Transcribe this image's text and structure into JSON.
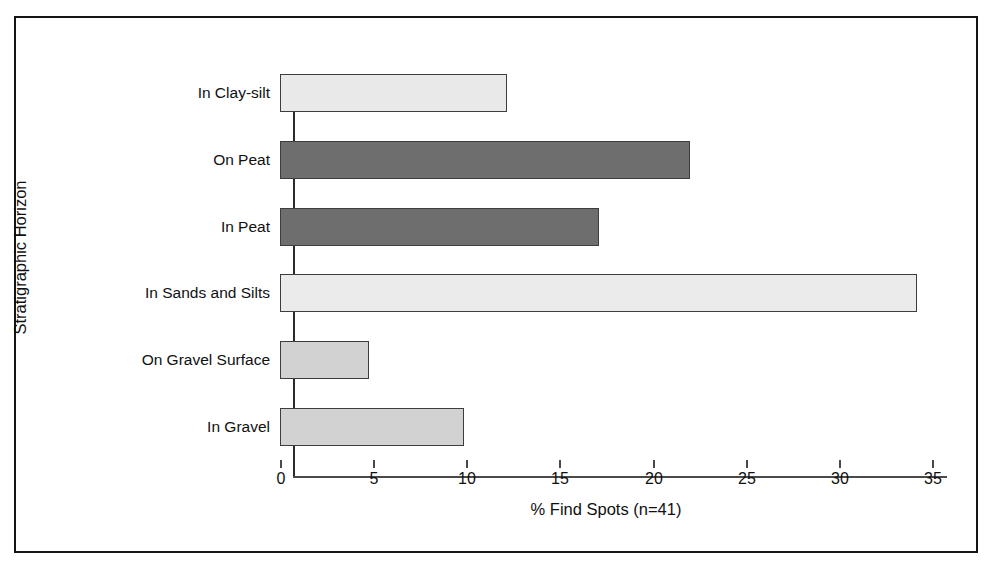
{
  "figure": {
    "background_color": "#ffffff",
    "frame_color": "#141414",
    "axis_color": "#4a4a4a"
  },
  "chart_data": {
    "type": "bar",
    "orientation": "horizontal",
    "title": "",
    "subtitle": "",
    "xlabel": "% Find Spots (n=41)",
    "ylabel": "Stratigraphic Horizon",
    "xlim": [
      0,
      35
    ],
    "xticks": [
      0,
      5,
      10,
      15,
      20,
      25,
      30,
      35
    ],
    "xtick_labels": [
      "0",
      "5",
      "10",
      "15",
      "20",
      "25",
      "30",
      "35"
    ],
    "grid": false,
    "legend": "none",
    "categories": [
      "In Clay-silt",
      "On Peat",
      "In Peat",
      "In Sands and Silts",
      "On Gravel Surface",
      "In Gravel"
    ],
    "values": [
      12.2,
      22.0,
      17.1,
      34.2,
      4.8,
      9.9
    ],
    "bar_colors": [
      "#e9e9e9",
      "#6e6e6e",
      "#6e6e6e",
      "#ebebeb",
      "#d2d2d2",
      "#d2d2d2"
    ],
    "bar_edge_color": "#3d3d3d",
    "series": [
      {
        "name": "% Find Spots",
        "values": [
          12.2,
          22.0,
          17.1,
          34.2,
          4.8,
          9.9
        ]
      }
    ]
  }
}
